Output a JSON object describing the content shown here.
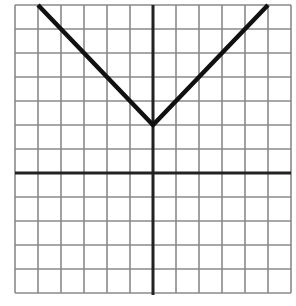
{
  "chart_data": {
    "type": "line",
    "title": "",
    "xlabel": "",
    "ylabel": "",
    "xlim": [
      -6,
      6
    ],
    "ylim": [
      -5,
      7
    ],
    "grid": true,
    "grid_step": 1,
    "axes_origin": [
      0,
      0
    ],
    "function": "y = |x| + 2",
    "series": [
      {
        "name": "absolute value graph",
        "x": [
          -5,
          -4,
          -3,
          -2,
          -1,
          0,
          1,
          2,
          3,
          4,
          5
        ],
        "y": [
          7,
          6,
          5,
          4,
          3,
          2,
          3,
          4,
          5,
          6,
          7
        ]
      }
    ],
    "vertex": [
      0,
      2
    ],
    "colors": {
      "grid": "#8a8a8a",
      "axis": "#222222",
      "line": "#111111",
      "background": "#ffffff"
    }
  }
}
